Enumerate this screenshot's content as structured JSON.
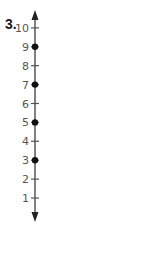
{
  "problem": {
    "number": "3."
  },
  "number_line": {
    "orientation": "vertical",
    "min": 1,
    "max": 10,
    "ticks": [
      1,
      2,
      3,
      4,
      5,
      6,
      7,
      8,
      9,
      10
    ],
    "tick_labels": [
      "1",
      "2",
      "3",
      "4",
      "5",
      "6",
      "7",
      "8",
      "9",
      "10"
    ],
    "points": [
      3,
      5,
      7,
      9
    ],
    "arrows": "both ends",
    "colors": {
      "line": "#555555",
      "point": "#111111",
      "label": "#555555"
    }
  }
}
